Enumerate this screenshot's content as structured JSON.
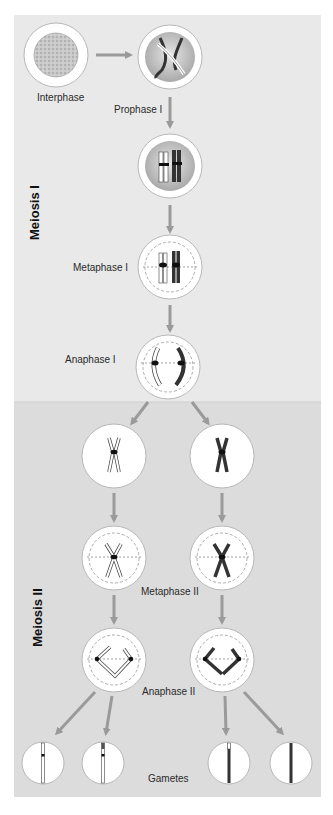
{
  "title": "Meiosis",
  "phases": {
    "meiosis_1": "Meiosis I",
    "meiosis_2": "Meiosis II"
  },
  "labels": {
    "interphase": "Interphase",
    "prophase_1": "Prophase I",
    "metaphase_1": "Metaphase I",
    "anaphase_1": "Anaphase I",
    "metaphase_2": "Metaphase II",
    "anaphase_2": "Anaphase II",
    "gametes": "Gametes"
  },
  "colors": {
    "panel_top": "#e9e9e9",
    "panel_bottom": "#dcdcdc",
    "arrow": "#9a9a9a",
    "cell_fill": "#ffffff",
    "nucleus": "#bdbdbd",
    "dark_chromosome": "#3a3a3a",
    "light_chromosome": "#ffffff"
  }
}
